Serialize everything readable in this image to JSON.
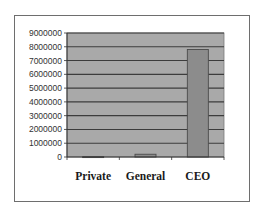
{
  "chart_data": {
    "type": "bar",
    "title": "",
    "xlabel": "",
    "ylabel": "",
    "categories": [
      "Private",
      "General",
      "CEO"
    ],
    "values": [
      30000,
      200000,
      7800000
    ],
    "ylim": [
      0,
      9000000
    ],
    "yticks": [
      0,
      1000000,
      2000000,
      3000000,
      4000000,
      5000000,
      6000000,
      7000000,
      8000000,
      9000000
    ],
    "ytick_labels": [
      "0",
      "1000000",
      "2000000",
      "3000000",
      "4000000",
      "5000000",
      "6000000",
      "7000000",
      "8000000",
      "9000000"
    ],
    "grid": true,
    "legend": "none",
    "colors": {
      "plot_background": "#a9a9a9",
      "bar_fill": "#8c8c8c",
      "bar_stroke": "#4a4a4a",
      "gridline": "#3c3c3c"
    }
  }
}
